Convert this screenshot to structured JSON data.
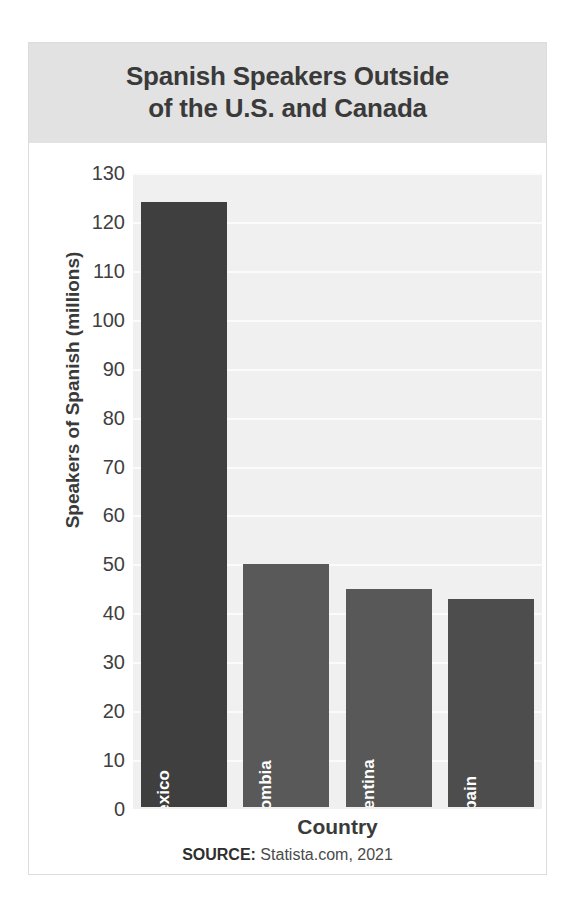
{
  "chart_data": {
    "type": "bar",
    "title": "Spanish Speakers Outside of the U.S. and Canada",
    "title_line1": "Spanish Speakers Outside",
    "title_line2": "of the U.S. and Canada",
    "xlabel": "Country",
    "ylabel": "Speakers of Spanish (millions)",
    "categories": [
      "Mexico",
      "Colombia",
      "Argentina",
      "Spain"
    ],
    "values": [
      124,
      50,
      45,
      43
    ],
    "ylim": [
      0,
      130
    ],
    "ytick_step": 10,
    "yticks": [
      130,
      120,
      110,
      100,
      90,
      80,
      70,
      60,
      50,
      40,
      30,
      20,
      10,
      0
    ],
    "grid": true,
    "legend": "none",
    "bar_colors": [
      "#3f3f3f",
      "#595959",
      "#585858",
      "#4d4d4d"
    ],
    "bar_label_color": "#ffffff",
    "plot_background": "#f0f0f0",
    "gridline_color": "#fbfbfb",
    "title_band_color": "#e2e2e2",
    "text_color": "#3a3a3a"
  },
  "source": {
    "prefix": "SOURCE:",
    "text": "Statista.com, 2021"
  }
}
